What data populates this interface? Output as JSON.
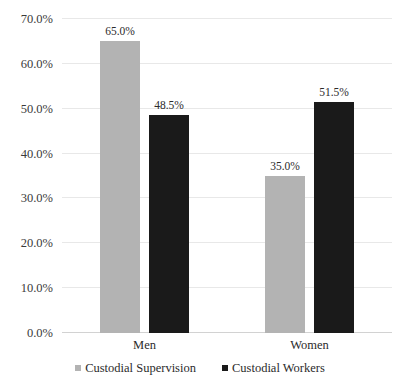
{
  "chart_data": {
    "type": "bar",
    "title": "",
    "subtitle": "",
    "xlabel": "",
    "ylabel": "",
    "categories": [
      "Men",
      "Women"
    ],
    "series": [
      {
        "name": "Custodial Supervision",
        "color": "#b3b3b3",
        "values": [
          65.0,
          35.0
        ],
        "labels": [
          "65.0%",
          "35.0%"
        ]
      },
      {
        "name": "Custodial Workers",
        "color": "#1a1a1a",
        "values": [
          48.5,
          51.5
        ],
        "labels": [
          "48.5%",
          "51.5%"
        ]
      }
    ],
    "ylim": [
      0,
      70
    ],
    "ytick_values": [
      0,
      10,
      20,
      30,
      40,
      50,
      60,
      70
    ],
    "ytick_labels": [
      "0.0%",
      "10.0%",
      "20.0%",
      "30.0%",
      "40.0%",
      "50.0%",
      "60.0%",
      "70.0%"
    ],
    "grid": true,
    "grid_axis": "y",
    "legend_position": "bottom",
    "value_labels_shown": true
  },
  "axis": {
    "y_ticks": [
      {
        "label": "70.0%",
        "value": 70
      },
      {
        "label": "60.0%",
        "value": 60
      },
      {
        "label": "50.0%",
        "value": 50
      },
      {
        "label": "40.0%",
        "value": 40
      },
      {
        "label": "30.0%",
        "value": 30
      },
      {
        "label": "20.0%",
        "value": 20
      },
      {
        "label": "10.0%",
        "value": 10
      },
      {
        "label": "0.0%",
        "value": 0
      }
    ]
  },
  "categories": [
    {
      "label": "Men"
    },
    {
      "label": "Women"
    }
  ],
  "bars": [
    {
      "group": "Men",
      "series": "Custodial Supervision",
      "value_label": "65.0%"
    },
    {
      "group": "Men",
      "series": "Custodial Workers",
      "value_label": "48.5%"
    },
    {
      "group": "Women",
      "series": "Custodial Supervision",
      "value_label": "35.0%"
    },
    {
      "group": "Women",
      "series": "Custodial Workers",
      "value_label": "51.5%"
    }
  ],
  "legend": {
    "items": [
      {
        "label": "Custodial Supervision",
        "color": "#b3b3b3"
      },
      {
        "label": "Custodial Workers",
        "color": "#1a1a1a"
      }
    ]
  },
  "colors": {
    "series_custodial_supervision": "#b3b3b3",
    "series_custodial_workers": "#1a1a1a",
    "gridline": "#e8e8e8",
    "baseline": "#d2d2d2",
    "background": "#ffffff",
    "text": "#2b2b2b"
  }
}
